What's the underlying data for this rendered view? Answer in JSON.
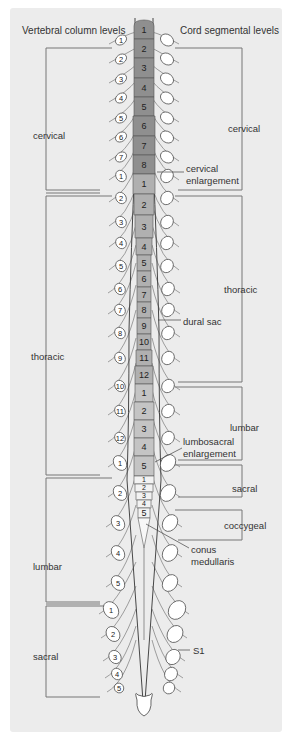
{
  "headers": {
    "left": "Vertebral column levels",
    "right": "Cord segmental levels"
  },
  "vertebral_regions": [
    {
      "name": "cervical",
      "count": 7
    },
    {
      "name": "thoracic",
      "count": 12
    },
    {
      "name": "lumbar",
      "count": 5
    },
    {
      "name": "sacral",
      "count": 5
    }
  ],
  "cord_regions": [
    {
      "name": "cervical",
      "segments": [
        "1",
        "2",
        "3",
        "4",
        "5",
        "6",
        "7",
        "8"
      ]
    },
    {
      "name": "thoracic",
      "segments": [
        "1",
        "2",
        "3",
        "4",
        "5",
        "6",
        "7",
        "8",
        "9",
        "10",
        "11",
        "12"
      ]
    },
    {
      "name": "lumbar",
      "segments": [
        "1",
        "2",
        "3",
        "4",
        "5"
      ]
    },
    {
      "name": "sacral",
      "segments": [
        "1",
        "2",
        "3",
        "4",
        "5"
      ]
    },
    {
      "name": "coccygeal",
      "segments": []
    }
  ],
  "annotations": {
    "cervical_enlargement": [
      "cervical",
      "enlargement"
    ],
    "dural_sac": "dural sac",
    "lumbosacral_enlargement": [
      "lumbosacral",
      "enlargement"
    ],
    "conus_medullaris": [
      "conus",
      "medullaris"
    ],
    "s1": "S1"
  },
  "left_labels": {
    "cervical": "cervical",
    "thoracic": "thoracic",
    "lumbar": "lumbar",
    "sacral": "sacral"
  },
  "right_labels": {
    "cervical": "cervical",
    "thoracic": "thoracic",
    "lumbar": "lumbar",
    "sacral": "sacral",
    "coccygeal": "coccygeal"
  },
  "colors": {
    "background": "#ececec",
    "cervical_cord": "#8f8f8f",
    "thoracic_cord": "#b0b0b0",
    "lumbar_cord": "#c4c4c4",
    "sacral_cord": "#f2f2f2",
    "lines": "#666666"
  }
}
